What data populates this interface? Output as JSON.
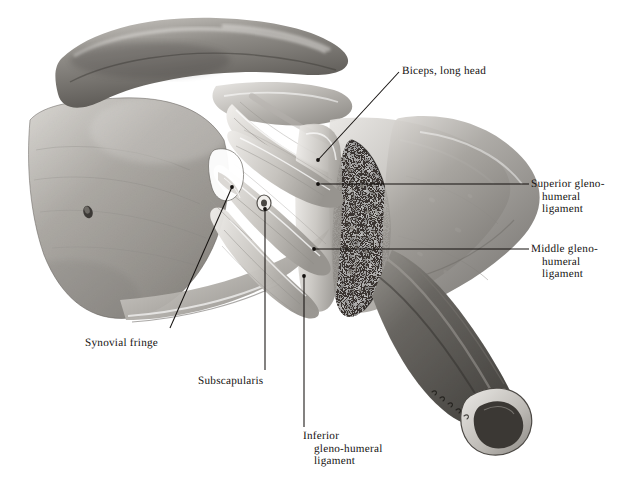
{
  "plate": {
    "title": "Gleno-humeral ligaments of the shoulder joint",
    "background_color": "#ffffff",
    "ink_color": "#14110f",
    "signature": "artist signature"
  },
  "labels": {
    "biceps": {
      "line1": "Biceps, long head"
    },
    "superior": {
      "line1": "Superior gleno-",
      "line2": "humeral",
      "line3": "ligament"
    },
    "middle": {
      "line1": "Middle gleno-",
      "line2": "humeral",
      "line3": "ligament"
    },
    "synovial": {
      "line1": "Synovial fringe"
    },
    "subscapularis": {
      "line1": "Subscapularis"
    },
    "inferior": {
      "line1": "Inferior",
      "line2": "gleno-humeral",
      "line3": "ligament"
    }
  },
  "structures": [
    {
      "name": "scapula-blade"
    },
    {
      "name": "coraco-acromial-arch"
    },
    {
      "name": "biceps-long-head-tendon"
    },
    {
      "name": "superior-gleno-humeral-ligament"
    },
    {
      "name": "middle-gleno-humeral-ligament"
    },
    {
      "name": "inferior-gleno-humeral-ligament"
    },
    {
      "name": "subscapularis-tendon"
    },
    {
      "name": "synovial-fringe"
    },
    {
      "name": "glenoid-cancellous-bone"
    },
    {
      "name": "humeral-shaft-cut-surface"
    }
  ]
}
